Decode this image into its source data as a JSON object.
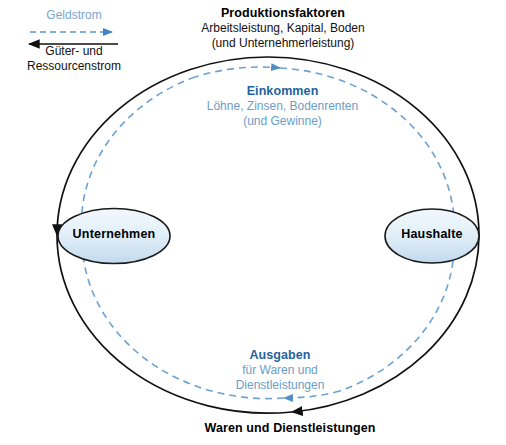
{
  "diagram": {
    "colors": {
      "money_flow": "#5b94c8",
      "money_title": "#23639e",
      "money_sub": "#6b9dc6",
      "goods_flow": "#111111",
      "node_fill_light": "#eaf3fa",
      "node_fill_dark": "#c5dcee",
      "node_stroke": "#1a1a1a",
      "background": "#ffffff"
    },
    "legend": {
      "money_label": "Geldstrom",
      "goods_label_line1": "Güter- und",
      "goods_label_line2": "Ressourcenstrom",
      "money_arrow_direction": "right",
      "goods_arrow_direction": "left"
    },
    "labels": {
      "production": {
        "title": "Produktionsfaktoren",
        "line1": "Arbeitsleistung, Kapital, Boden",
        "line2": "(und Unternehmerleistung)"
      },
      "income": {
        "title": "Einkommen",
        "line1": "Löhne, Zinsen, Bodenrenten",
        "line2": "(und Gewinne)"
      },
      "spending": {
        "title": "Ausgaben",
        "line1": "für Waren und",
        "line2": "Dienstleistungen"
      },
      "goods": {
        "title": "Waren und Dienstleistungen"
      }
    },
    "nodes": [
      {
        "id": "firms",
        "label": "Unternehmen"
      },
      {
        "id": "households",
        "label": "Haushalte"
      }
    ],
    "flows": [
      {
        "id": "production-factors",
        "from": "households",
        "to": "firms",
        "type": "goods",
        "position": "top",
        "direction": "left"
      },
      {
        "id": "income",
        "from": "firms",
        "to": "households",
        "type": "money",
        "position": "top-inner",
        "direction": "right"
      },
      {
        "id": "goods-services",
        "from": "firms",
        "to": "households",
        "type": "goods",
        "position": "bottom",
        "direction": "right"
      },
      {
        "id": "spending",
        "from": "households",
        "to": "firms",
        "type": "money",
        "position": "bottom-inner",
        "direction": "left"
      }
    ]
  }
}
